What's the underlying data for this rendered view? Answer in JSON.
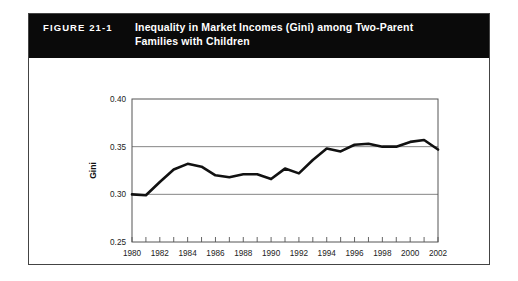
{
  "figure": {
    "number_label": "FIGURE 21-1",
    "title": "Inequality in Market Incomes (Gini) among Two-Parent Families with Children",
    "title_line1": "Inequality in Market Incomes (Gini) among Two-Parent",
    "title_line2": "Families with Children",
    "header_bg": "#0a0a0a",
    "header_text_color": "#ffffff",
    "border_color": "#444444"
  },
  "chart_data": {
    "type": "line",
    "title": "Inequality in Market Incomes (Gini) among Two-Parent Families with Children",
    "xlabel": "Year",
    "ylabel": "Gini",
    "xlim": [
      1980,
      2002
    ],
    "ylim": [
      0.25,
      0.4
    ],
    "grid": true,
    "grid_axis": "y",
    "legend": false,
    "line_color": "#111111",
    "x": [
      1980,
      1981,
      1982,
      1983,
      1984,
      1985,
      1986,
      1987,
      1988,
      1989,
      1990,
      1991,
      1992,
      1993,
      1994,
      1995,
      1996,
      1997,
      1998,
      1999,
      2000,
      2001,
      2002
    ],
    "values": [
      0.3,
      0.299,
      0.313,
      0.326,
      0.332,
      0.329,
      0.32,
      0.318,
      0.321,
      0.321,
      0.316,
      0.327,
      0.322,
      0.336,
      0.348,
      0.345,
      0.352,
      0.353,
      0.35,
      0.35,
      0.355,
      0.357,
      0.347
    ],
    "ytick_labels": [
      "0.40",
      "0.35",
      "0.30",
      "0.25"
    ],
    "ytick_values": [
      0.4,
      0.35,
      0.3,
      0.25
    ],
    "xtick_labels": [
      "1980",
      "1982",
      "1984",
      "1986",
      "1988",
      "1990",
      "1992",
      "1994",
      "1996",
      "1998",
      "2000",
      "2002"
    ],
    "xtick_values": [
      1980,
      1982,
      1984,
      1986,
      1988,
      1990,
      1992,
      1994,
      1996,
      1998,
      2000,
      2002
    ],
    "xtick_minor_interval": 1
  }
}
